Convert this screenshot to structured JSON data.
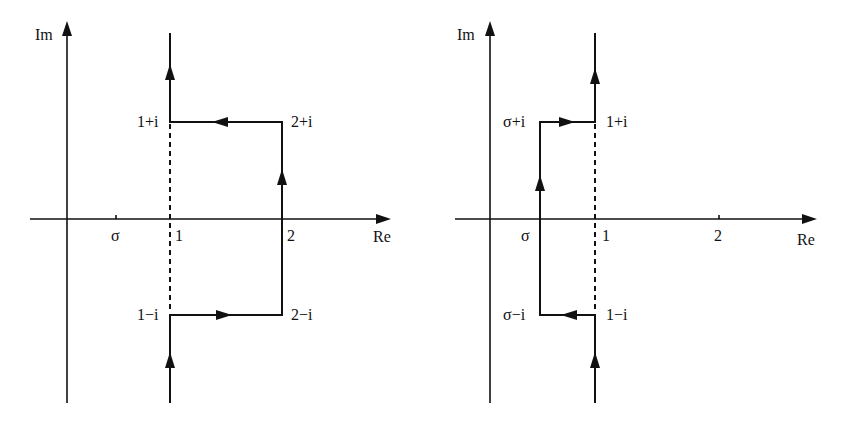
{
  "left_diagram": {
    "axes": {
      "x_label": "Re",
      "y_label": "Im"
    },
    "ticks": {
      "sigma": "σ",
      "one": "1",
      "two": "2"
    },
    "points": {
      "p1": "1+i",
      "p2": "2+i",
      "p3": "1−i",
      "p4": "2−i"
    },
    "description": "Contour: up from -∞ along Re=1 to 1−i, right to 2−i, up to 2+i, left to 1+i, up to +∞; dashed segment on Re=1 between 1−i and 1+i"
  },
  "right_diagram": {
    "axes": {
      "x_label": "Re",
      "y_label": "Im"
    },
    "ticks": {
      "sigma": "σ",
      "one": "1",
      "two": "2"
    },
    "points": {
      "p1": "σ+i",
      "p2": "1+i",
      "p3": "σ−i",
      "p4": "1−i"
    },
    "description": "Contour: up from -∞ along Re=1 to 1−i, left to σ−i, up to σ+i, right to 1+i, up to +∞; dashed segment on Re=1 between 1−i and 1+i"
  },
  "colors": {
    "ink": "#111111",
    "background": "#ffffff"
  }
}
